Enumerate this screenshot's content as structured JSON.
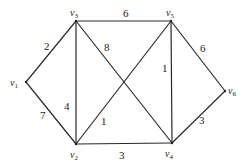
{
  "diagram": {
    "type": "weighted-undirected-graph",
    "nodes": [
      {
        "id": "v1",
        "label": "v",
        "sub": "1",
        "x": 26,
        "y": 82,
        "lx": 10,
        "ly": 86
      },
      {
        "id": "v2",
        "label": "v",
        "sub": "2",
        "x": 76,
        "y": 144,
        "lx": 70,
        "ly": 158
      },
      {
        "id": "v3",
        "label": "v",
        "sub": "3",
        "x": 76,
        "y": 21,
        "lx": 70,
        "ly": 16
      },
      {
        "id": "v4",
        "label": "v",
        "sub": "4",
        "x": 172,
        "y": 143,
        "lx": 165,
        "ly": 157
      },
      {
        "id": "v5",
        "label": "v",
        "sub": "5",
        "x": 171,
        "y": 21,
        "lx": 166,
        "ly": 16
      },
      {
        "id": "v6",
        "label": "v",
        "sub": "6",
        "x": 225,
        "y": 91,
        "lx": 228,
        "ly": 94
      }
    ],
    "edges": [
      {
        "from": "v1",
        "to": "v3",
        "weight": "2",
        "lx": 44,
        "ly": 50
      },
      {
        "from": "v1",
        "to": "v2",
        "weight": "7",
        "lx": 40,
        "ly": 119
      },
      {
        "from": "v3",
        "to": "v5",
        "weight": "6",
        "lx": 123,
        "ly": 17
      },
      {
        "from": "v3",
        "to": "v2",
        "weight": "4",
        "lx": 64,
        "ly": 110
      },
      {
        "from": "v3",
        "to": "v4",
        "weight": "8",
        "lx": 104,
        "ly": 51
      },
      {
        "from": "v5",
        "to": "v2",
        "weight": "1",
        "lx": 101,
        "ly": 125
      },
      {
        "from": "v5",
        "to": "v4",
        "weight": "1",
        "lx": 162,
        "ly": 72
      },
      {
        "from": "v5",
        "to": "v6",
        "weight": "6",
        "lx": 200,
        "ly": 52
      },
      {
        "from": "v2",
        "to": "v4",
        "weight": "3",
        "lx": 119,
        "ly": 159
      },
      {
        "from": "v4",
        "to": "v6",
        "weight": "3",
        "lx": 199,
        "ly": 124
      }
    ]
  }
}
